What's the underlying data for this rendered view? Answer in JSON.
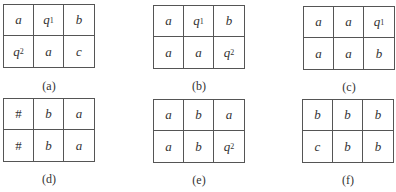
{
  "panels": [
    {
      "label": "(a)",
      "cells": [
        {
          "sym": "a",
          "sub": ""
        },
        {
          "sym": "q",
          "sub": "1"
        },
        {
          "sym": "b",
          "sub": ""
        },
        {
          "sym": "q",
          "sub": "2"
        },
        {
          "sym": "a",
          "sub": ""
        },
        {
          "sym": "c",
          "sub": ""
        }
      ]
    },
    {
      "label": "(b)",
      "cells": [
        {
          "sym": "a",
          "sub": ""
        },
        {
          "sym": "q",
          "sub": "1"
        },
        {
          "sym": "b",
          "sub": ""
        },
        {
          "sym": "a",
          "sub": ""
        },
        {
          "sym": "a",
          "sub": ""
        },
        {
          "sym": "q",
          "sub": "2"
        }
      ]
    },
    {
      "label": "(c)",
      "cells": [
        {
          "sym": "a",
          "sub": ""
        },
        {
          "sym": "a",
          "sub": ""
        },
        {
          "sym": "q",
          "sub": "1"
        },
        {
          "sym": "a",
          "sub": ""
        },
        {
          "sym": "a",
          "sub": ""
        },
        {
          "sym": "b",
          "sub": ""
        }
      ]
    },
    {
      "label": "(d)",
      "cells": [
        {
          "sym": "#",
          "sub": ""
        },
        {
          "sym": "b",
          "sub": ""
        },
        {
          "sym": "a",
          "sub": ""
        },
        {
          "sym": "#",
          "sub": ""
        },
        {
          "sym": "b",
          "sub": ""
        },
        {
          "sym": "a",
          "sub": ""
        }
      ]
    },
    {
      "label": "(e)",
      "cells": [
        {
          "sym": "a",
          "sub": ""
        },
        {
          "sym": "b",
          "sub": ""
        },
        {
          "sym": "a",
          "sub": ""
        },
        {
          "sym": "a",
          "sub": ""
        },
        {
          "sym": "b",
          "sub": ""
        },
        {
          "sym": "q",
          "sub": "2"
        }
      ]
    },
    {
      "label": "(f)",
      "cells": [
        {
          "sym": "b",
          "sub": ""
        },
        {
          "sym": "b",
          "sub": ""
        },
        {
          "sym": "b",
          "sub": ""
        },
        {
          "sym": "c",
          "sub": ""
        },
        {
          "sym": "b",
          "sub": ""
        },
        {
          "sym": "b",
          "sub": ""
        }
      ]
    }
  ]
}
